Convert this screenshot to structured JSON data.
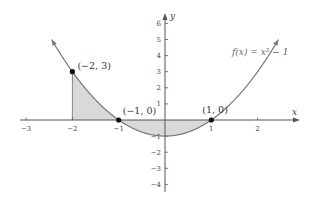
{
  "chart_data": {
    "type": "line",
    "title": "",
    "function": "f(x) = x^2 - 1",
    "function_label": "f(x) = x² − 1",
    "xlabel": "x",
    "ylabel": "y",
    "xlim": [
      -3.2,
      2.9
    ],
    "ylim": [
      -4.3,
      6.7
    ],
    "x_ticks": [
      -3,
      -2,
      -1,
      1,
      2
    ],
    "x_tick_labels": [
      "−3",
      "−2",
      "−1",
      "1",
      "2"
    ],
    "y_ticks": [
      6,
      5,
      4,
      3,
      2,
      1,
      -1,
      -2,
      -3,
      -4
    ],
    "y_tick_labels": [
      "6",
      "5",
      "4",
      "3",
      "2",
      "1",
      "−1",
      "−2",
      "−3",
      "−4"
    ],
    "grid": false,
    "curve_domain": [
      -2.45,
      2.45
    ],
    "shaded_region": {
      "x_from": -2,
      "x_to": 1,
      "between": "f(x) and x-axis"
    },
    "points": [
      {
        "x": -2,
        "y": 3,
        "label": "(−2, 3)"
      },
      {
        "x": -1,
        "y": 0,
        "label": "(−1, 0)"
      },
      {
        "x": 1,
        "y": 0,
        "label": "(1, 0)"
      }
    ],
    "colors": {
      "curve": "#777777",
      "fill": "#d9d9d9",
      "axis": "#555555",
      "point": "#111111"
    }
  }
}
